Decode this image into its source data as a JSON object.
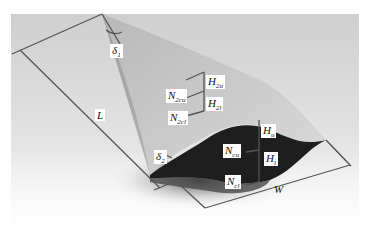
{
  "figure": {
    "type": "3D surface schematic of a tapered membrane/film",
    "colors": {
      "background_light": "#eeeeee",
      "background_mid": "#d6d6d6",
      "surface_light": "#c8c8c8",
      "surface_mid": "#a9a9a9",
      "cavity_dark": "#1e1e1e",
      "dimension_line": "#555555"
    },
    "labels": {
      "delta1": {
        "main": "δ",
        "sub": "1"
      },
      "delta2": {
        "main": "δ",
        "sub": "2"
      },
      "L": {
        "main": "L",
        "sub": ""
      },
      "W": {
        "main": "W",
        "sub": ""
      },
      "N2cu": {
        "main": "N",
        "sub": "2cu"
      },
      "N2cl": {
        "main": "N",
        "sub": "2cl"
      },
      "H2u": {
        "main": "H",
        "sub": "2u"
      },
      "H2l": {
        "main": "H",
        "sub": "2l"
      },
      "Ncu": {
        "main": "N",
        "sub": "cu"
      },
      "Ncl": {
        "main": "N",
        "sub": "cl"
      },
      "Hu": {
        "main": "H",
        "sub": "u"
      },
      "Hl": {
        "main": "H",
        "sub": "l"
      }
    }
  }
}
